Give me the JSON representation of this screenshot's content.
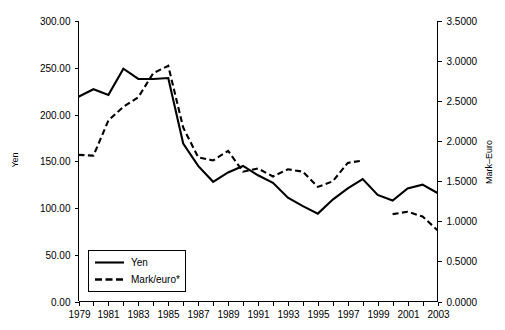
{
  "chart_data": {
    "type": "line",
    "title": "",
    "xlabel": "",
    "ylabel": "Yen",
    "y2label": "Mark–Euro",
    "grid": false,
    "legend_position": "bottom-left",
    "x": [
      1979,
      1980,
      1981,
      1982,
      1983,
      1984,
      1985,
      1986,
      1987,
      1988,
      1989,
      1990,
      1991,
      1992,
      1993,
      1994,
      1995,
      1996,
      1997,
      1998,
      1999,
      2000,
      2001,
      2002,
      2003
    ],
    "x_ticks": [
      1979,
      1980,
      1981,
      1982,
      1983,
      1984,
      1985,
      1986,
      1987,
      1988,
      1989,
      1990,
      1991,
      1992,
      1993,
      1994,
      1995,
      1996,
      1997,
      1998,
      1999,
      2000,
      2001,
      2002,
      2003
    ],
    "x_tick_labels": [
      "1979",
      "",
      "1981",
      "",
      "1983",
      "",
      "1985",
      "",
      "1987",
      "",
      "1989",
      "",
      "1991",
      "",
      "1993",
      "",
      "1995",
      "",
      "1997",
      "",
      "1999",
      "",
      "2001",
      "",
      "2003"
    ],
    "xlim": [
      1979,
      2003
    ],
    "ylim": [
      0.0,
      300.0
    ],
    "y_ticks": [
      0.0,
      50.0,
      100.0,
      150.0,
      200.0,
      250.0,
      300.0
    ],
    "y_tick_labels": [
      "0.00",
      "50.00",
      "100.00",
      "150.00",
      "200.00",
      "250.00",
      "300.00"
    ],
    "y2lim": [
      0.0,
      3.5
    ],
    "y2_ticks": [
      0.0,
      0.5,
      1.0,
      1.5,
      2.0,
      2.5,
      3.0,
      3.5
    ],
    "y2_tick_labels": [
      "0.0000",
      "0.5000",
      "1.0000",
      "1.5000",
      "2.0000",
      "2.5000",
      "3.0000",
      "3.5000"
    ],
    "series": [
      {
        "name": "Yen",
        "axis": "left",
        "style": "solid",
        "color": "#000000",
        "values": [
          219.0,
          227.0,
          221.0,
          249.0,
          238.0,
          238.0,
          239.0,
          169.0,
          145.0,
          128.0,
          138.0,
          145.0,
          135.0,
          127.0,
          111.0,
          102.0,
          94.0,
          109.0,
          121.0,
          131.0,
          114.0,
          108.0,
          121.0,
          125.0,
          116.0
        ]
      },
      {
        "name": "Mark/euro*",
        "axis": "right",
        "style": "dashed",
        "color": "#000000",
        "values": [
          1.83,
          1.82,
          2.26,
          2.43,
          2.55,
          2.85,
          2.94,
          2.17,
          1.8,
          1.76,
          1.88,
          1.62,
          1.66,
          1.56,
          1.65,
          1.62,
          1.43,
          1.5,
          1.73,
          1.76,
          null,
          1.09,
          1.12,
          1.06,
          0.89
        ]
      }
    ]
  },
  "legend": {
    "items": [
      {
        "label": "Yen",
        "style": "solid"
      },
      {
        "label": "Mark/euro*",
        "style": "dashed"
      }
    ]
  },
  "axes": {
    "left_title": "Yen",
    "right_title": "Mark–Euro"
  }
}
